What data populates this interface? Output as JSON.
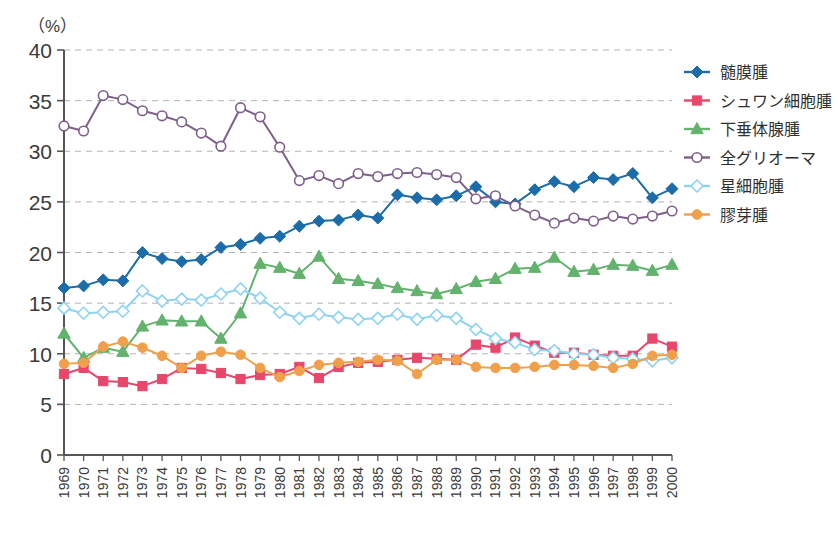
{
  "chart_data": {
    "type": "line",
    "title": "",
    "xlabel": "",
    "ylabel": "",
    "yunit": "（%）",
    "ylim": [
      0,
      40
    ],
    "yticks": [
      0,
      5,
      10,
      15,
      20,
      25,
      30,
      35,
      40
    ],
    "grid": true,
    "legend_position": "right",
    "categories": [
      "1969",
      "1970",
      "1971",
      "1972",
      "1973",
      "1974",
      "1975",
      "1976",
      "1977",
      "1978",
      "1979",
      "1980",
      "1981",
      "1982",
      "1983",
      "1984",
      "1985",
      "1986",
      "1987",
      "1988",
      "1989",
      "1990",
      "1991",
      "1992",
      "1993",
      "1994",
      "1995",
      "1996",
      "1997",
      "1998",
      "1999",
      "2000"
    ],
    "series": [
      {
        "name": "髄膜腫",
        "color": "#1b6ca8",
        "marker": "diamond",
        "filled": true,
        "values": [
          16.5,
          16.7,
          17.3,
          17.2,
          20.0,
          19.4,
          19.1,
          19.3,
          20.5,
          20.8,
          21.4,
          21.6,
          22.6,
          23.1,
          23.2,
          23.7,
          23.4,
          25.7,
          25.4,
          25.2,
          25.6,
          26.5,
          25.0,
          24.8,
          26.2,
          27.0,
          26.5,
          27.4,
          27.2,
          27.8,
          25.4,
          26.3
        ]
      },
      {
        "name": "シュワン細胞腫",
        "color": "#e8476b",
        "marker": "square",
        "filled": true,
        "values": [
          8.0,
          8.6,
          7.3,
          7.2,
          6.8,
          7.5,
          8.6,
          8.5,
          8.1,
          7.5,
          7.9,
          8.0,
          8.7,
          7.6,
          8.7,
          9.1,
          9.2,
          9.4,
          9.6,
          9.5,
          9.4,
          10.9,
          10.6,
          11.6,
          10.8,
          10.1,
          10.1,
          9.9,
          9.8,
          9.8,
          11.5,
          10.7
        ]
      },
      {
        "name": "下垂体腺腫",
        "color": "#63b26e",
        "marker": "triangle",
        "filled": true,
        "values": [
          12.0,
          9.6,
          10.6,
          10.2,
          12.7,
          13.3,
          13.2,
          13.2,
          11.5,
          14.0,
          18.9,
          18.5,
          17.9,
          19.6,
          17.4,
          17.2,
          16.9,
          16.5,
          16.2,
          15.9,
          16.4,
          17.1,
          17.4,
          18.4,
          18.5,
          19.5,
          18.1,
          18.3,
          18.8,
          18.7,
          18.2,
          18.8
        ]
      },
      {
        "name": "全グリオーマ",
        "color": "#7d5f8a",
        "marker": "circle",
        "filled": false,
        "values": [
          32.5,
          32.0,
          35.5,
          35.1,
          34.0,
          33.5,
          32.9,
          31.8,
          30.5,
          34.3,
          33.4,
          30.4,
          27.1,
          27.6,
          26.8,
          27.8,
          27.5,
          27.8,
          27.9,
          27.7,
          27.4,
          25.3,
          25.6,
          24.6,
          23.7,
          22.9,
          23.4,
          23.1,
          23.6,
          23.3,
          23.6,
          24.1
        ]
      },
      {
        "name": "星細胞腫",
        "color": "#8ed3f0",
        "marker": "diamond",
        "filled": false,
        "values": [
          14.5,
          14.0,
          14.1,
          14.2,
          16.2,
          15.2,
          15.4,
          15.3,
          15.9,
          16.4,
          15.5,
          14.1,
          13.5,
          13.9,
          13.6,
          13.4,
          13.5,
          13.9,
          13.4,
          13.8,
          13.5,
          12.4,
          11.5,
          11.1,
          10.4,
          10.3,
          10.0,
          9.9,
          9.6,
          9.5,
          9.3,
          9.6
        ]
      },
      {
        "name": "膠芽腫",
        "color": "#f0a04b",
        "marker": "circle",
        "filled": true,
        "values": [
          9.0,
          9.1,
          10.7,
          11.2,
          10.6,
          9.8,
          8.6,
          9.8,
          10.2,
          9.9,
          8.6,
          7.7,
          8.3,
          8.9,
          9.1,
          9.2,
          9.4,
          9.3,
          8.0,
          9.4,
          9.4,
          8.7,
          8.6,
          8.6,
          8.7,
          8.9,
          8.9,
          8.8,
          8.6,
          9.0,
          9.8,
          9.9
        ]
      }
    ]
  }
}
